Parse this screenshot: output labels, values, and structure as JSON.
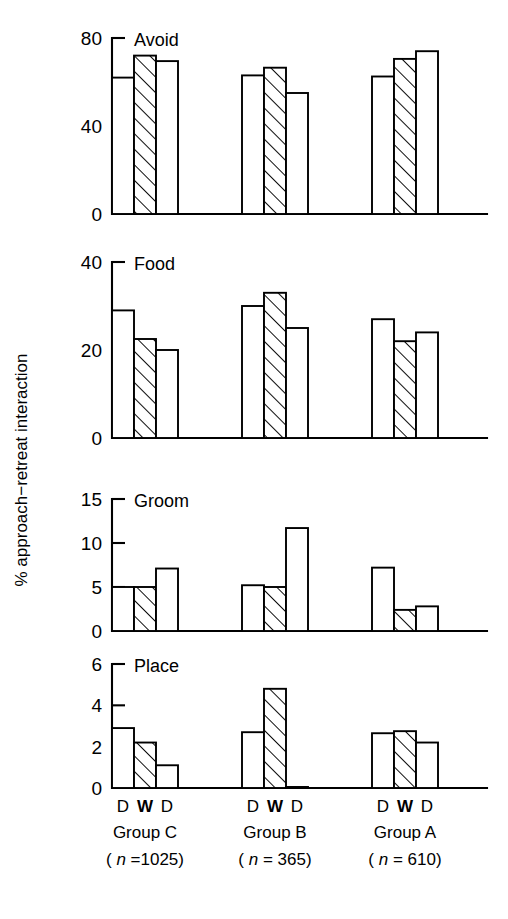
{
  "chart_data": {
    "type": "bar",
    "title": "",
    "subtitle": "",
    "ylabel": "% approach−retreat interaction",
    "xlabel": "",
    "grid": false,
    "legend_position": "none",
    "orientation": "vertical",
    "bar_fill_styles": {
      "D": "open-white",
      "W": "diagonal-hatched"
    },
    "x_tick_labels": [
      "D",
      "W",
      "D"
    ],
    "groups": [
      {
        "name": "Group C",
        "n_label": "( n =1025)",
        "n": 1025
      },
      {
        "name": "Group B",
        "n_label": "( n = 365)",
        "n": 365
      },
      {
        "name": "Group A",
        "n_label": "( n = 610)",
        "n": 610
      }
    ],
    "panels": [
      {
        "label": "Avoid",
        "ylim": [
          0,
          80
        ],
        "yticks": [
          0,
          40,
          80
        ],
        "ytick_labels": [
          "0",
          "40",
          "80"
        ],
        "series": [
          {
            "name": "Group C",
            "categories": [
              "D",
              "W",
              "D"
            ],
            "values": [
              62,
              72,
              69.5
            ]
          },
          {
            "name": "Group B",
            "categories": [
              "D",
              "W",
              "D"
            ],
            "values": [
              63,
              66.5,
              55
            ]
          },
          {
            "name": "Group A",
            "categories": [
              "D",
              "W",
              "D"
            ],
            "values": [
              62.5,
              70.5,
              74
            ]
          }
        ]
      },
      {
        "label": "Food",
        "ylim": [
          0,
          40
        ],
        "yticks": [
          0,
          20,
          40
        ],
        "ytick_labels": [
          "0",
          "20",
          "40"
        ],
        "series": [
          {
            "name": "Group C",
            "categories": [
              "D",
              "W",
              "D"
            ],
            "values": [
              29,
              22.5,
              20
            ]
          },
          {
            "name": "Group B",
            "categories": [
              "D",
              "W",
              "D"
            ],
            "values": [
              30,
              33,
              25
            ]
          },
          {
            "name": "Group A",
            "categories": [
              "D",
              "W",
              "D"
            ],
            "values": [
              27,
              22,
              24
            ]
          }
        ]
      },
      {
        "label": "Groom",
        "ylim": [
          0,
          15
        ],
        "yticks": [
          0,
          5,
          10,
          15
        ],
        "ytick_labels": [
          "0",
          "5",
          "10",
          "15"
        ],
        "series": [
          {
            "name": "Group C",
            "categories": [
              "D",
              "W",
              "D"
            ],
            "values": [
              5.0,
              5.0,
              7.1
            ]
          },
          {
            "name": "Group B",
            "categories": [
              "D",
              "W",
              "D"
            ],
            "values": [
              5.2,
              5.0,
              11.7
            ]
          },
          {
            "name": "Group A",
            "categories": [
              "D",
              "W",
              "D"
            ],
            "values": [
              7.2,
              2.4,
              2.8
            ]
          }
        ]
      },
      {
        "label": "Place",
        "ylim": [
          0,
          6
        ],
        "yticks": [
          0,
          2,
          4,
          6
        ],
        "ytick_labels": [
          "0",
          "2",
          "4",
          "6"
        ],
        "series": [
          {
            "name": "Group C",
            "categories": [
              "D",
              "W",
              "D"
            ],
            "values": [
              2.9,
              2.2,
              1.1
            ]
          },
          {
            "name": "Group B",
            "categories": [
              "D",
              "W",
              "D"
            ],
            "values": [
              2.7,
              4.8,
              0.05
            ]
          },
          {
            "name": "Group A",
            "categories": [
              "D",
              "W",
              "D"
            ],
            "values": [
              2.65,
              2.75,
              2.2
            ]
          }
        ]
      }
    ],
    "colors": {
      "ink": "#000000",
      "background": "#ffffff",
      "bar_fill": "#ffffff",
      "hatch": "#000000"
    }
  }
}
